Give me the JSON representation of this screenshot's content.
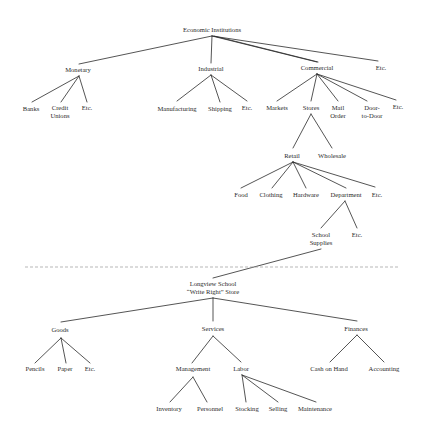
{
  "diagram": {
    "type": "hierarchy-tree",
    "line_color": "#2a2a2a",
    "divider_color": "#9a9a9a",
    "upper_tree": {
      "root": "Economic Institutions",
      "children": [
        {
          "label": "Monetary",
          "children": [
            "Banks",
            "Credit Unions",
            "Etc."
          ]
        },
        {
          "label": "Industrial",
          "children": [
            "Manufacturing",
            "Shipping",
            "Etc."
          ]
        },
        {
          "label": "Commercial",
          "children": [
            "Markets",
            {
              "label": "Stores",
              "children": [
                {
                  "label": "Retail",
                  "children": [
                    "Food",
                    "Clothing",
                    "Hardware",
                    {
                      "label": "Department",
                      "children": [
                        "School Supplies",
                        "Etc."
                      ]
                    },
                    "Etc."
                  ]
                },
                "Wholesale"
              ]
            },
            "Mail Order",
            "Door-to-Door",
            "Etc."
          ]
        },
        "Etc."
      ]
    },
    "lower_tree": {
      "root": "Longview School “Write Right” Store",
      "children": [
        {
          "label": "Goods",
          "children": [
            "Pencils",
            "Paper",
            "Etc."
          ]
        },
        {
          "label": "Services",
          "children": [
            {
              "label": "Management",
              "children": [
                "Inventory",
                "Personnel"
              ]
            },
            {
              "label": "Labor",
              "children": [
                "Stocking",
                "Selling",
                "Maintenance"
              ]
            }
          ]
        },
        {
          "label": "Finances",
          "children": [
            "Cash on Hand",
            "Accounting"
          ]
        }
      ]
    }
  },
  "nodes": {
    "economic_institutions": "Economic Institutions",
    "monetary": "Monetary",
    "industrial": "Industrial",
    "commercial": "Commercial",
    "etc_top": "Etc.",
    "banks": "Banks",
    "credit": "Credit",
    "unions": "Unions",
    "etc_monetary": "Etc.",
    "manufacturing": "Manufacturing",
    "shipping": "Shipping",
    "etc_industrial": "Etc.",
    "markets": "Markets",
    "stores": "Stores",
    "mail": "Mail",
    "order": "Order",
    "door": "Door-",
    "to_door": "to-Door",
    "etc_commercial": "Etc.",
    "retail": "Retail",
    "wholesale": "Wholesale",
    "food": "Food",
    "clothing": "Clothing",
    "hardware": "Hardware",
    "department": "Department",
    "etc_retail": "Etc.",
    "school": "School",
    "supplies": "Supplies",
    "etc_department": "Etc.",
    "longview_line1": "Longview School",
    "longview_line2": "“Write Right” Store",
    "goods": "Goods",
    "services": "Services",
    "finances": "Finances",
    "pencils": "Pencils",
    "paper": "Paper",
    "etc_goods": "Etc.",
    "management": "Management",
    "labor": "Labor",
    "inventory": "Inventory",
    "personnel": "Personnel",
    "stocking": "Stocking",
    "selling": "Selling",
    "maintenance": "Maintenance",
    "cash_on_hand": "Cash on Hand",
    "accounting": "Accounting"
  }
}
